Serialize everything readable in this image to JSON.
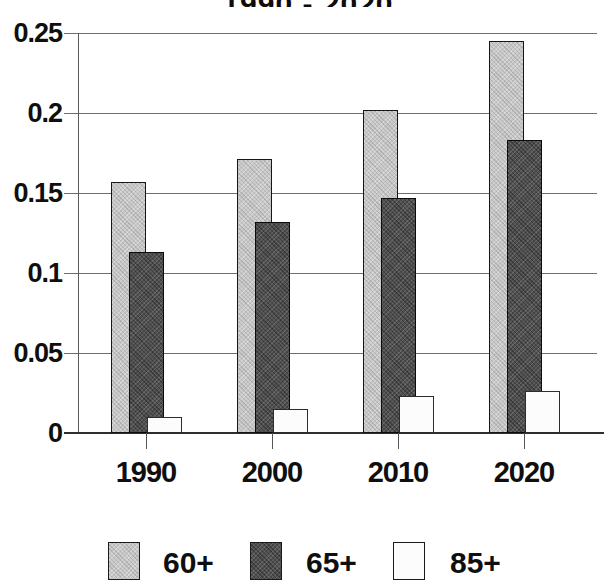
{
  "chart_data": {
    "type": "bar",
    "title": "1990 - 2020",
    "categories": [
      "1990",
      "2000",
      "2010",
      "2020"
    ],
    "series": [
      {
        "name": "60+",
        "color": "#c7c7c7",
        "values": [
          0.157,
          0.171,
          0.202,
          0.245
        ]
      },
      {
        "name": "65+",
        "color": "#4f4f4f",
        "values": [
          0.113,
          0.132,
          0.147,
          0.183
        ]
      },
      {
        "name": "85+",
        "color": "#fcfcfc",
        "values": [
          0.01,
          0.015,
          0.023,
          0.026
        ]
      }
    ],
    "y_ticks": [
      {
        "value": 0,
        "label": "0"
      },
      {
        "value": 0.05,
        "label": "0.05"
      },
      {
        "value": 0.1,
        "label": "0.1"
      },
      {
        "value": 0.15,
        "label": "0.15"
      },
      {
        "value": 0.2,
        "label": "0.2"
      },
      {
        "value": 0.25,
        "label": "0.25"
      }
    ],
    "ylim": [
      0,
      0.25
    ],
    "xlabel": "",
    "ylabel": "",
    "grid": true,
    "legend_position": "bottom",
    "bar_style": "overlapped"
  }
}
